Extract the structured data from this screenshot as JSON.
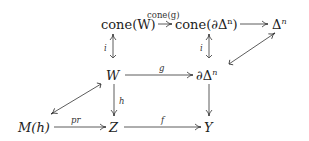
{
  "diagram": {
    "nodes": {
      "coneW": "cone(W)",
      "coneDelta": "cone(∂Δ",
      "coneDelta_sup": "n",
      "coneDelta_close": ")",
      "Delta": "Δ",
      "Delta_sup": "n",
      "W": "W",
      "dDelta": "∂Δ",
      "dDelta_sup": "n",
      "Mh": "M(h)",
      "Z": "Z",
      "Y": "Y"
    },
    "edges": {
      "coneg": "cone(g)",
      "i_left": "i",
      "i_right": "i",
      "g": "g",
      "h": "h",
      "pr": "pr",
      "f": "f"
    },
    "colors": {
      "line": "#333333",
      "text": "#222222"
    }
  }
}
